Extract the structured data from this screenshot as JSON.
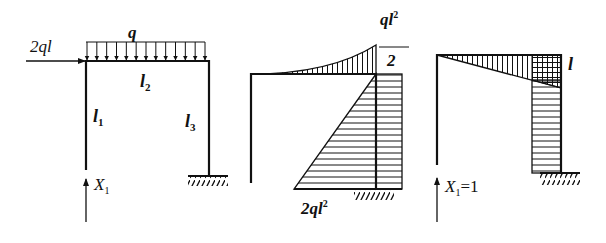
{
  "figure": {
    "panels": [
      {
        "id": "loading",
        "description": "Original frame with loads",
        "labels": {
          "horizontal_load": "2ql",
          "distributed_load": "q",
          "beam_length": "l",
          "beam_sub": "2",
          "left_col_length": "l",
          "left_col_sub": "1",
          "right_col_length": "l",
          "right_col_sub": "3",
          "redundant": "X",
          "redundant_sub": "1"
        },
        "load_arrow_count": 13
      },
      {
        "id": "mp_diagram",
        "description": "Bending moment diagram M_P",
        "labels": {
          "peak_num": "ql",
          "peak_exp": "2",
          "peak_den": "2",
          "base_value": "2ql",
          "base_exp": "2"
        }
      },
      {
        "id": "m1_diagram",
        "description": "Unit moment diagram M_1",
        "labels": {
          "corner_value": "l",
          "unit_load": "X",
          "unit_load_sub": "1",
          "unit_load_value": "=1"
        }
      }
    ],
    "colors": {
      "line": "#111111",
      "background": "#ffffff"
    }
  }
}
